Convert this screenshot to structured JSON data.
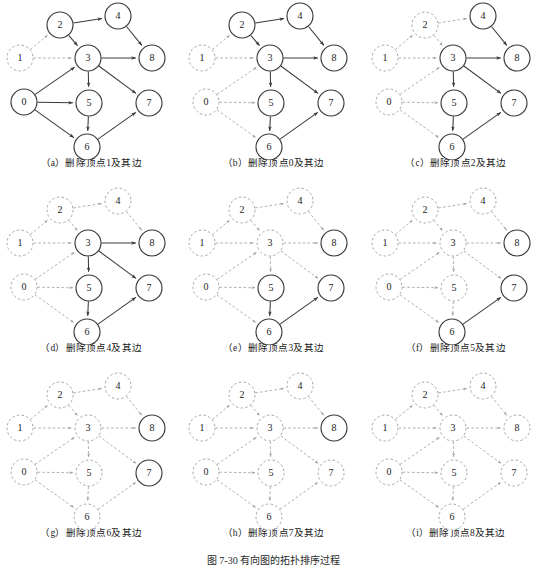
{
  "figure": {
    "caption": "图 7-30  有向图的拓扑排序过程",
    "columns": 3,
    "rows": 3,
    "node_labels": [
      "0",
      "1",
      "2",
      "3",
      "4",
      "5",
      "6",
      "7",
      "8"
    ],
    "colors": {
      "active_stroke": "#3a3a3a",
      "deleted_stroke": "#9a9a9a",
      "text": "#1c1c1c",
      "background": "#ffffff"
    }
  },
  "graph": {
    "nodes": [
      {
        "id": "0",
        "label": "0",
        "x": 24,
        "y": 102
      },
      {
        "id": "1",
        "label": "1",
        "x": 20,
        "y": 58
      },
      {
        "id": "2",
        "label": "2",
        "x": 60,
        "y": 25
      },
      {
        "id": "3",
        "label": "3",
        "x": 88,
        "y": 58
      },
      {
        "id": "4",
        "label": "4",
        "x": 118,
        "y": 16
      },
      {
        "id": "5",
        "label": "5",
        "x": 89,
        "y": 103
      },
      {
        "id": "6",
        "label": "6",
        "x": 87,
        "y": 147
      },
      {
        "id": "7",
        "label": "7",
        "x": 149,
        "y": 103
      },
      {
        "id": "8",
        "label": "8",
        "x": 152,
        "y": 58
      }
    ],
    "radius": 13,
    "edges": [
      {
        "from": "1",
        "to": "2"
      },
      {
        "from": "1",
        "to": "3"
      },
      {
        "from": "2",
        "to": "4"
      },
      {
        "from": "2",
        "to": "3"
      },
      {
        "from": "0",
        "to": "3"
      },
      {
        "from": "0",
        "to": "5"
      },
      {
        "from": "0",
        "to": "6"
      },
      {
        "from": "3",
        "to": "8"
      },
      {
        "from": "3",
        "to": "5"
      },
      {
        "from": "3",
        "to": "7"
      },
      {
        "from": "4",
        "to": "8"
      },
      {
        "from": "5",
        "to": "6"
      },
      {
        "from": "6",
        "to": "7"
      }
    ]
  },
  "panels": [
    {
      "key": "a",
      "caption": "（a）删除顶点1及其边",
      "deleted_nodes": [
        "1"
      ],
      "deleted_edges": [
        [
          "1",
          "2"
        ],
        [
          "1",
          "3"
        ]
      ]
    },
    {
      "key": "b",
      "caption": "（b）删除顶点0及其边",
      "deleted_nodes": [
        "1",
        "0"
      ],
      "deleted_edges": [
        [
          "1",
          "2"
        ],
        [
          "1",
          "3"
        ],
        [
          "0",
          "3"
        ],
        [
          "0",
          "5"
        ],
        [
          "0",
          "6"
        ]
      ]
    },
    {
      "key": "c",
      "caption": "（c）删除顶点2及其边",
      "deleted_nodes": [
        "1",
        "0",
        "2"
      ],
      "deleted_edges": [
        [
          "1",
          "2"
        ],
        [
          "1",
          "3"
        ],
        [
          "0",
          "3"
        ],
        [
          "0",
          "5"
        ],
        [
          "0",
          "6"
        ],
        [
          "2",
          "4"
        ],
        [
          "2",
          "3"
        ]
      ]
    },
    {
      "key": "d",
      "caption": "（d）删除顶点4及其边",
      "deleted_nodes": [
        "1",
        "0",
        "2",
        "4"
      ],
      "deleted_edges": [
        [
          "1",
          "2"
        ],
        [
          "1",
          "3"
        ],
        [
          "0",
          "3"
        ],
        [
          "0",
          "5"
        ],
        [
          "0",
          "6"
        ],
        [
          "2",
          "4"
        ],
        [
          "2",
          "3"
        ],
        [
          "4",
          "8"
        ]
      ]
    },
    {
      "key": "e",
      "caption": "（e）删除顶点3及其边",
      "deleted_nodes": [
        "1",
        "0",
        "2",
        "4",
        "3"
      ],
      "deleted_edges": [
        [
          "1",
          "2"
        ],
        [
          "1",
          "3"
        ],
        [
          "0",
          "3"
        ],
        [
          "0",
          "5"
        ],
        [
          "0",
          "6"
        ],
        [
          "2",
          "4"
        ],
        [
          "2",
          "3"
        ],
        [
          "4",
          "8"
        ],
        [
          "3",
          "8"
        ],
        [
          "3",
          "5"
        ],
        [
          "3",
          "7"
        ]
      ]
    },
    {
      "key": "f",
      "caption": "（f）删除顶点5及其边",
      "deleted_nodes": [
        "1",
        "0",
        "2",
        "4",
        "3",
        "5"
      ],
      "deleted_edges": [
        [
          "1",
          "2"
        ],
        [
          "1",
          "3"
        ],
        [
          "0",
          "3"
        ],
        [
          "0",
          "5"
        ],
        [
          "0",
          "6"
        ],
        [
          "2",
          "4"
        ],
        [
          "2",
          "3"
        ],
        [
          "4",
          "8"
        ],
        [
          "3",
          "8"
        ],
        [
          "3",
          "5"
        ],
        [
          "3",
          "7"
        ],
        [
          "5",
          "6"
        ]
      ]
    },
    {
      "key": "g",
      "caption": "（g）删除顶点6及其边",
      "deleted_nodes": [
        "1",
        "0",
        "2",
        "4",
        "3",
        "5",
        "6"
      ],
      "deleted_edges": [
        [
          "1",
          "2"
        ],
        [
          "1",
          "3"
        ],
        [
          "0",
          "3"
        ],
        [
          "0",
          "5"
        ],
        [
          "0",
          "6"
        ],
        [
          "2",
          "4"
        ],
        [
          "2",
          "3"
        ],
        [
          "4",
          "8"
        ],
        [
          "3",
          "8"
        ],
        [
          "3",
          "5"
        ],
        [
          "3",
          "7"
        ],
        [
          "5",
          "6"
        ],
        [
          "6",
          "7"
        ]
      ]
    },
    {
      "key": "h",
      "caption": "（h）删除顶点7及其边",
      "deleted_nodes": [
        "1",
        "0",
        "2",
        "4",
        "3",
        "5",
        "6",
        "7"
      ],
      "deleted_edges": [
        [
          "1",
          "2"
        ],
        [
          "1",
          "3"
        ],
        [
          "0",
          "3"
        ],
        [
          "0",
          "5"
        ],
        [
          "0",
          "6"
        ],
        [
          "2",
          "4"
        ],
        [
          "2",
          "3"
        ],
        [
          "4",
          "8"
        ],
        [
          "3",
          "8"
        ],
        [
          "3",
          "5"
        ],
        [
          "3",
          "7"
        ],
        [
          "5",
          "6"
        ],
        [
          "6",
          "7"
        ]
      ]
    },
    {
      "key": "i",
      "caption": "（i）删除顶点8及其边",
      "deleted_nodes": [
        "1",
        "0",
        "2",
        "4",
        "3",
        "5",
        "6",
        "7",
        "8"
      ],
      "deleted_edges": [
        [
          "1",
          "2"
        ],
        [
          "1",
          "3"
        ],
        [
          "0",
          "3"
        ],
        [
          "0",
          "5"
        ],
        [
          "0",
          "6"
        ],
        [
          "2",
          "4"
        ],
        [
          "2",
          "3"
        ],
        [
          "4",
          "8"
        ],
        [
          "3",
          "8"
        ],
        [
          "3",
          "5"
        ],
        [
          "3",
          "7"
        ],
        [
          "5",
          "6"
        ],
        [
          "6",
          "7"
        ]
      ]
    }
  ]
}
